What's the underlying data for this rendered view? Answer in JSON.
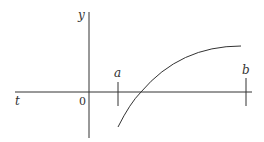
{
  "diagram": {
    "labels": {
      "y_axis": "y",
      "t_axis": "t",
      "origin": "0",
      "a": "a",
      "b": "b"
    },
    "colors": {
      "stroke": "#333333",
      "background": "#ffffff"
    }
  }
}
